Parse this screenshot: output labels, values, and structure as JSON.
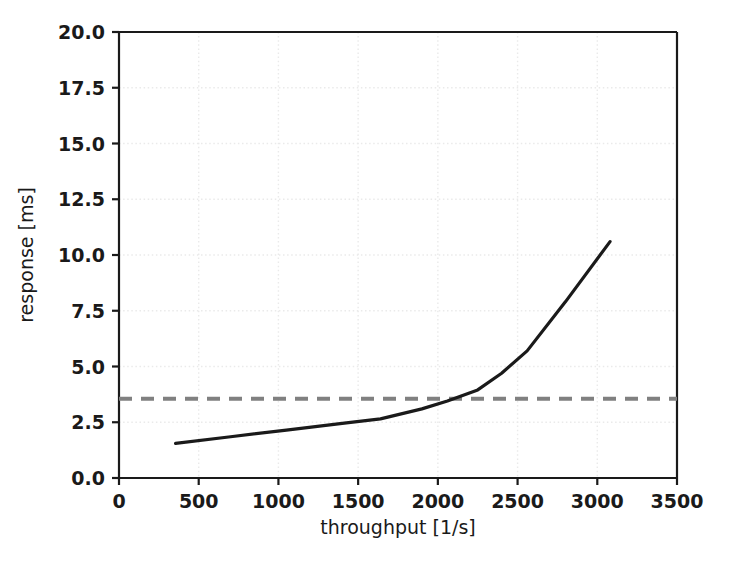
{
  "chart_data": {
    "type": "line",
    "title": "",
    "xlabel": "throughput [1/s]",
    "ylabel": "response [ms]",
    "xlim": [
      0,
      3500
    ],
    "ylim": [
      0,
      20
    ],
    "xticks": [
      0,
      500,
      1000,
      1500,
      2000,
      2500,
      3000,
      3500
    ],
    "yticks": [
      0.0,
      2.5,
      5.0,
      7.5,
      10.0,
      12.5,
      15.0,
      17.5,
      20.0
    ],
    "xtick_labels": [
      "0",
      "500",
      "1000",
      "1500",
      "2000",
      "2500",
      "3000",
      "3500"
    ],
    "ytick_labels": [
      "0.0",
      "2.5",
      "5.0",
      "7.5",
      "10.0",
      "12.5",
      "15.0",
      "17.5",
      "20.0"
    ],
    "grid": true,
    "grid_style": "dotted",
    "grid_color": "#eaeaea",
    "legend": "none",
    "series": [
      {
        "name": "response",
        "style": "solid",
        "color": "#1a1a1a",
        "width": 3.2,
        "x": [
          355,
          700,
          1050,
          1400,
          1640,
          1900,
          2060,
          2250,
          2400,
          2560,
          2800,
          3080
        ],
        "y": [
          1.55,
          1.85,
          2.15,
          2.45,
          2.65,
          3.1,
          3.45,
          3.95,
          4.7,
          5.7,
          7.9,
          10.6
        ]
      }
    ],
    "reference_lines": [
      {
        "name": "sla-threshold",
        "orientation": "horizontal",
        "value": 3.55,
        "style": "dashed",
        "color": "#808080",
        "width": 4
      }
    ],
    "annotations": []
  },
  "figure": {
    "background_color": "#ffffff",
    "axes_color": "#1a1a1a"
  }
}
